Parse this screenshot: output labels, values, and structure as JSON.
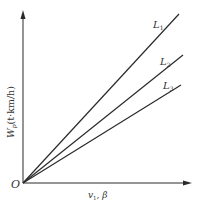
{
  "diagram": {
    "origin_label": "O",
    "y_axis": {
      "label_main": "W",
      "label_sub": "p",
      "label_unit": "(t·km/h)"
    },
    "x_axis": {
      "label_main": "v",
      "label_sub": "1",
      "label_rest": ", β"
    },
    "lines": [
      {
        "name": "L",
        "sub": "1",
        "x2": 179,
        "y2": 14,
        "lx": 153,
        "ly": 28
      },
      {
        "name": "L",
        "sub": "2",
        "x2": 183,
        "y2": 55,
        "lx": 160,
        "ly": 65
      },
      {
        "name": "L",
        "sub": "3",
        "x2": 181,
        "y2": 85,
        "lx": 163,
        "ly": 90
      }
    ],
    "colors": {
      "line": "#2a2a2a",
      "text": "#333333",
      "background": "#ffffff"
    }
  }
}
